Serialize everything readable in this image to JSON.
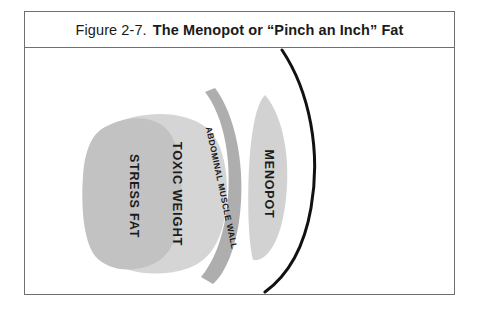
{
  "figure": {
    "caption_number": "Figure 2-7.",
    "caption_title": "The Menopot or “Pinch an Inch” Fat",
    "border_color": "#6e6e73",
    "background": "#ffffff"
  },
  "diagram": {
    "type": "anatomical-cross-section",
    "outline_color": "#111111",
    "layers": [
      {
        "id": "stress-fat",
        "label": "STRESS FAT",
        "color": "#c2c2c2",
        "shape": "rounded-blob",
        "order": 1,
        "label_rotation_deg": 90
      },
      {
        "id": "toxic-weight",
        "label": "TOXIC WEIGHT",
        "color": "#d5d5d5",
        "shape": "rounded-blob",
        "order": 2,
        "label_rotation_deg": 90
      },
      {
        "id": "abdominal-muscle-wall",
        "label": "ABDOMINAL MUSCLE WALL",
        "color": "#aeaeae",
        "shape": "curved-band",
        "order": 3,
        "label_rotation_deg": 90
      },
      {
        "id": "menopot",
        "label": "MENOPOT",
        "color": "#d2d2d2",
        "shape": "lens-crescent",
        "order": 4,
        "label_rotation_deg": 90
      }
    ],
    "body_profile": {
      "id": "body-profile-curve",
      "color": "#111111",
      "stroke_width": 3
    }
  }
}
